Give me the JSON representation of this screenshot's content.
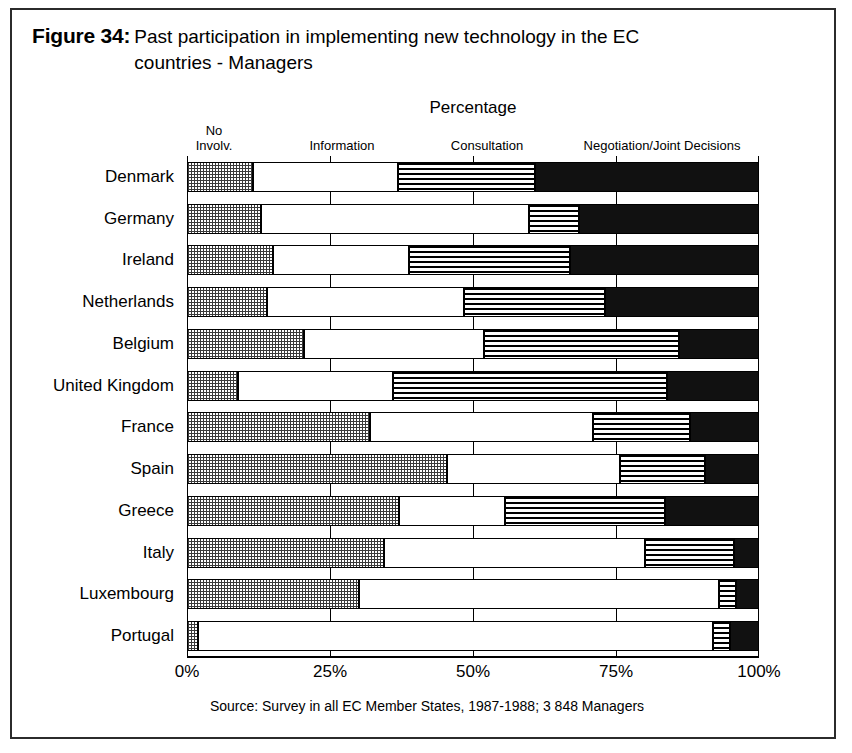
{
  "figure": {
    "label": "Figure 34:",
    "title": "Past participation in implementing new technology in the EC countries - Managers",
    "source": "Source: Survey in all EC Member States, 1987-1988; 3 848 Managers"
  },
  "chart_data": {
    "type": "bar",
    "orientation": "horizontal",
    "stacked": true,
    "title": "Percentage",
    "xlabel": "Percentage",
    "ylabel": "",
    "xlim": [
      0,
      100
    ],
    "xticks": [
      "0%",
      "25%",
      "50%",
      "75%",
      "100%"
    ],
    "xtick_values": [
      0,
      25,
      50,
      75,
      100
    ],
    "grid": true,
    "legend_position": "top",
    "categories": [
      "Denmark",
      "Germany",
      "Ireland",
      "Netherlands",
      "Belgium",
      "United Kingdom",
      "France",
      "Spain",
      "Greece",
      "Italy",
      "Luxembourg",
      "Portugal"
    ],
    "series": [
      {
        "name": "No Involv.",
        "legend_label": "No\nInvolv.",
        "pattern": "checkered",
        "values": [
          11.5,
          13.0,
          15.0,
          14.0,
          20.5,
          9.0,
          32.0,
          45.5,
          37.0,
          34.5,
          30.0,
          2.0
        ]
      },
      {
        "name": "Information",
        "legend_label": "Information",
        "pattern": "white",
        "values": [
          25.4,
          46.8,
          23.8,
          34.5,
          31.5,
          27.0,
          39.0,
          30.2,
          18.6,
          45.6,
          63.0,
          90.0
        ]
      },
      {
        "name": "Consultation",
        "legend_label": "Consultation",
        "pattern": "horizontal-stripes",
        "values": [
          23.9,
          8.7,
          28.2,
          24.5,
          34.0,
          48.0,
          17.0,
          14.9,
          28.0,
          15.5,
          3.0,
          3.0
        ]
      },
      {
        "name": "Negotiation/Joint Decisions",
        "legend_label": "Negotiation/Joint Decisions",
        "pattern": "solid-black",
        "values": [
          39.2,
          31.5,
          33.0,
          27.0,
          14.0,
          16.0,
          12.0,
          9.4,
          16.4,
          4.4,
          4.0,
          5.0
        ]
      }
    ]
  }
}
